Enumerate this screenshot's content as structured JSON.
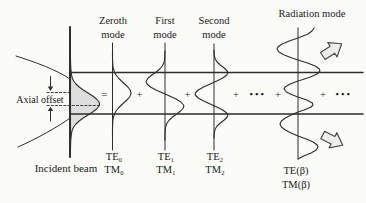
{
  "labels": {
    "modes_top": [
      {
        "line1": "Zeroth",
        "line2": "mode"
      },
      {
        "line1": "First",
        "line2": "mode"
      },
      {
        "line1": "Second",
        "line2": "mode"
      },
      {
        "line1": "Radiation mode",
        "line2": ""
      }
    ],
    "axial_offset": "Axial offset",
    "incident_beam": "Incident beam",
    "mode_designations": [
      {
        "te": "TE₀",
        "tm": "TM₀"
      },
      {
        "te": "TE₁",
        "tm": "TM₁"
      },
      {
        "te": "TE₂",
        "tm": "TM₂"
      },
      {
        "te": "TE(β)",
        "tm": "TM(β)"
      }
    ],
    "operators": [
      {
        "sym": "="
      },
      {
        "sym": "+"
      },
      {
        "sym": "+"
      },
      {
        "sym": "+"
      },
      {
        "sym": "•••"
      },
      {
        "sym": "+"
      },
      {
        "sym": "+"
      },
      {
        "sym": "•••"
      }
    ]
  },
  "icons": {
    "radiation_arrow_top": "block-arrow-up-right",
    "radiation_arrow_bottom": "block-arrow-down-right",
    "offset_arrow_down": "arrow-down",
    "offset_arrow_up": "arrow-up"
  },
  "colors": {
    "ink": "#2e2e2e",
    "light_line": "#9a9a9a",
    "beam_fill": "#dedede",
    "arrow_fill": "#ededea",
    "background": "#fbfbf8"
  }
}
